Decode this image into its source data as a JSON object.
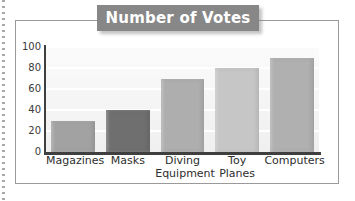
{
  "figure": {
    "title": "Number of Votes",
    "title_color": "#ffffff",
    "banner_color": "#878787",
    "frame_color": "#9a9a9a",
    "axis_color": "#3f3f3f"
  },
  "chart_data": {
    "type": "bar",
    "title": "Number of Votes",
    "xlabel": "",
    "ylabel": "",
    "categories": [
      "Magazines",
      "Masks",
      "Diving Equipment",
      "Toy Planes",
      "Computers"
    ],
    "values": [
      30,
      40,
      70,
      80,
      90
    ],
    "ylim": [
      0,
      100
    ],
    "yticks": [
      0,
      20,
      40,
      60,
      80,
      100
    ],
    "ytick_labels": [
      "0",
      "20",
      "40",
      "60",
      "80",
      "100"
    ],
    "grid": true,
    "grid_color": "#ffffff",
    "legend": null,
    "bar_colors": [
      "#a2a2a2",
      "#6f6f6f",
      "#aeaeae",
      "#c6c6c6",
      "#b0b0b0"
    ]
  },
  "x_label_lines": [
    [
      "Magazines"
    ],
    [
      "Masks"
    ],
    [
      "Diving",
      "Equipment"
    ],
    [
      "Toy",
      "Planes"
    ],
    [
      "Computers"
    ]
  ]
}
